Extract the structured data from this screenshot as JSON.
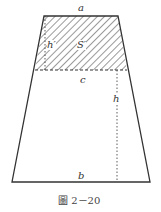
{
  "figure": {
    "caption": "圖 2－20",
    "labels": {
      "top": "a",
      "middle": "c",
      "bottom": "b",
      "height_total": "h",
      "height_top": "h′",
      "area_top": "S′"
    },
    "colors": {
      "line": "#333333",
      "hatch": "#555555",
      "background": "#ffffff"
    }
  }
}
